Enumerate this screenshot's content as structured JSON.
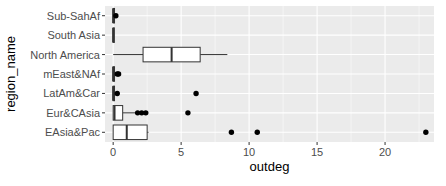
{
  "chart_data": {
    "type": "boxplot",
    "orientation": "horizontal",
    "title": "",
    "xlabel": "outdeg",
    "ylabel": "region_name",
    "xlim": [
      -0.6,
      23.6
    ],
    "x_ticks": [
      0,
      5,
      10,
      15,
      20
    ],
    "grid": true,
    "legend": "none",
    "categories": [
      "EAsia&Pac",
      "Eur&CAsia",
      "LatAm&Car",
      "mEast&NAf",
      "North America",
      "South Asia",
      "Sub-SahAf"
    ],
    "boxes": [
      {
        "name": "EAsia&Pac",
        "min": 0,
        "q1": 0,
        "median": 1,
        "q3": 2.5,
        "max": 2.6,
        "outliers": [
          8.7,
          10.6,
          23
        ]
      },
      {
        "name": "Eur&CAsia",
        "min": 0,
        "q1": 0,
        "median": 0.1,
        "q3": 0.7,
        "max": 1.7,
        "outliers": [
          1.8,
          2.1,
          2.4,
          5.5
        ]
      },
      {
        "name": "LatAm&Car",
        "min": 0,
        "q1": 0,
        "median": 0,
        "q3": 0.1,
        "max": 0.2,
        "outliers": [
          0.3,
          6.1
        ]
      },
      {
        "name": "mEast&NAf",
        "min": 0,
        "q1": 0,
        "median": 0,
        "q3": 0.1,
        "max": 0.2,
        "outliers": [
          0.3,
          0.4
        ]
      },
      {
        "name": "North America",
        "min": 0,
        "q1": 2.2,
        "median": 4.3,
        "q3": 6.4,
        "max": 8.4,
        "outliers": []
      },
      {
        "name": "South Asia",
        "min": 0,
        "q1": 0,
        "median": 0,
        "q3": 0,
        "max": 0,
        "outliers": []
      },
      {
        "name": "Sub-SahAf",
        "min": 0,
        "q1": 0,
        "median": 0,
        "q3": 0.1,
        "max": 0.1,
        "outliers": [
          0.2
        ]
      }
    ]
  },
  "colors": {
    "panel_bg": "#ebebeb",
    "grid_major": "#ffffff",
    "box_fill": "#ffffff",
    "box_line": "#333333",
    "outlier": "#000000"
  }
}
